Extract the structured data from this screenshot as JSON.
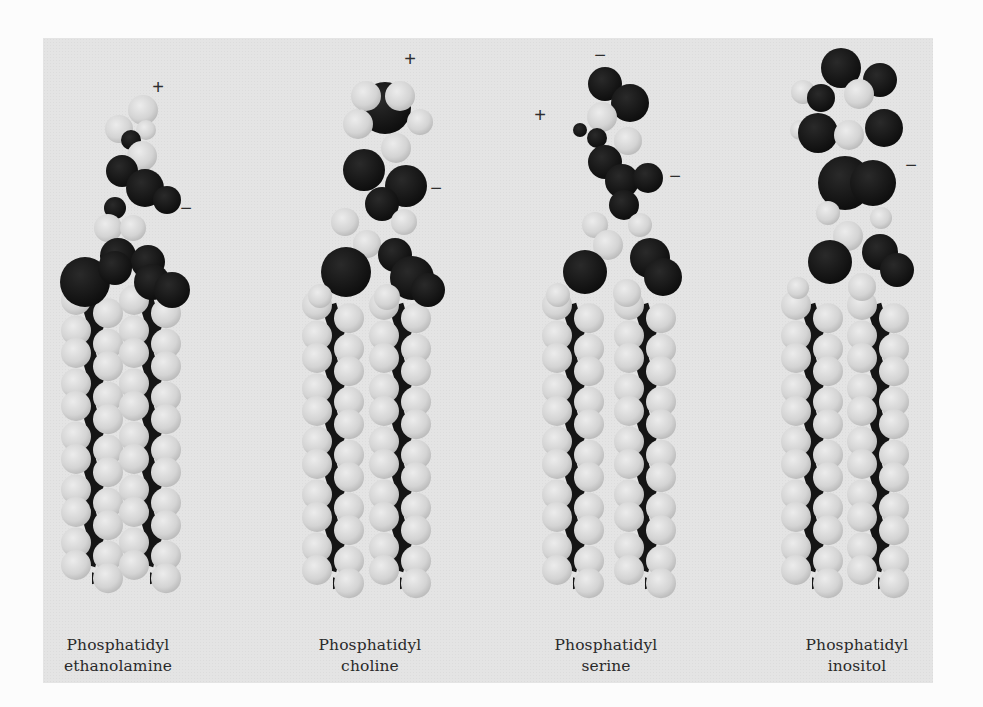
{
  "figure": {
    "background_color": "#e4e4e4",
    "dark_atom_color": "#161616",
    "light_atom_color": "#d9d9d9",
    "molecules": [
      {
        "id": "pe",
        "label_line1": "Phosphatidyl",
        "label_line2": "ethanolamine",
        "label_x": 18,
        "label_y": 635,
        "charges": [
          {
            "symbol": "+",
            "x": 158,
            "y": 87
          },
          {
            "symbol": "−",
            "x": 186,
            "y": 208
          }
        ],
        "tails": {
          "left_x": 92,
          "right_x": 150,
          "top_y": 300,
          "rows": 11,
          "step": 26.5,
          "offset": 14
        },
        "head_atoms": [
          {
            "t": "L",
            "x": 143,
            "y": 110,
            "r": 15
          },
          {
            "t": "L",
            "x": 119,
            "y": 129,
            "r": 14
          },
          {
            "t": "L",
            "x": 146,
            "y": 130,
            "r": 10
          },
          {
            "t": "D",
            "x": 131,
            "y": 140,
            "r": 10
          },
          {
            "t": "L",
            "x": 142,
            "y": 156,
            "r": 15
          },
          {
            "t": "D",
            "x": 122,
            "y": 171,
            "r": 16
          },
          {
            "t": "D",
            "x": 145,
            "y": 188,
            "r": 19
          },
          {
            "t": "D",
            "x": 167,
            "y": 200,
            "r": 14
          },
          {
            "t": "D",
            "x": 115,
            "y": 208,
            "r": 11
          },
          {
            "t": "L",
            "x": 108,
            "y": 228,
            "r": 14
          },
          {
            "t": "L",
            "x": 133,
            "y": 228,
            "r": 13
          },
          {
            "t": "D",
            "x": 118,
            "y": 256,
            "r": 18
          },
          {
            "t": "D",
            "x": 148,
            "y": 262,
            "r": 17
          },
          {
            "t": "D",
            "x": 85,
            "y": 282,
            "r": 25
          },
          {
            "t": "D",
            "x": 115,
            "y": 268,
            "r": 17
          },
          {
            "t": "D",
            "x": 152,
            "y": 282,
            "r": 18
          },
          {
            "t": "D",
            "x": 172,
            "y": 290,
            "r": 18
          }
        ]
      },
      {
        "id": "pc",
        "label_line1": "Phosphatidyl",
        "label_line2": "choline",
        "label_x": 270,
        "label_y": 635,
        "charges": [
          {
            "symbol": "+",
            "x": 410,
            "y": 59
          },
          {
            "symbol": "−",
            "x": 436,
            "y": 188
          }
        ],
        "tails": {
          "left_x": 333,
          "right_x": 400,
          "top_y": 305,
          "rows": 11,
          "step": 26.5,
          "offset": 14
        },
        "head_atoms": [
          {
            "t": "D",
            "x": 385,
            "y": 108,
            "r": 26
          },
          {
            "t": "L",
            "x": 366,
            "y": 96,
            "r": 15
          },
          {
            "t": "L",
            "x": 400,
            "y": 96,
            "r": 15
          },
          {
            "t": "L",
            "x": 358,
            "y": 124,
            "r": 15
          },
          {
            "t": "L",
            "x": 420,
            "y": 122,
            "r": 13
          },
          {
            "t": "L",
            "x": 396,
            "y": 148,
            "r": 15
          },
          {
            "t": "D",
            "x": 364,
            "y": 170,
            "r": 21
          },
          {
            "t": "D",
            "x": 406,
            "y": 186,
            "r": 21
          },
          {
            "t": "D",
            "x": 382,
            "y": 204,
            "r": 17
          },
          {
            "t": "L",
            "x": 345,
            "y": 222,
            "r": 14
          },
          {
            "t": "L",
            "x": 404,
            "y": 222,
            "r": 13
          },
          {
            "t": "L",
            "x": 367,
            "y": 244,
            "r": 14
          },
          {
            "t": "D",
            "x": 395,
            "y": 255,
            "r": 17
          },
          {
            "t": "D",
            "x": 346,
            "y": 272,
            "r": 25
          },
          {
            "t": "D",
            "x": 412,
            "y": 278,
            "r": 22
          },
          {
            "t": "D",
            "x": 428,
            "y": 290,
            "r": 17
          },
          {
            "t": "L",
            "x": 320,
            "y": 296,
            "r": 12
          },
          {
            "t": "L",
            "x": 387,
            "y": 297,
            "r": 13
          }
        ]
      },
      {
        "id": "ps",
        "label_line1": "Phosphatidyl",
        "label_line2": "serine",
        "label_x": 506,
        "label_y": 635,
        "charges": [
          {
            "symbol": "−",
            "x": 600,
            "y": 55
          },
          {
            "symbol": "+",
            "x": 540,
            "y": 115
          },
          {
            "symbol": "−",
            "x": 675,
            "y": 176
          }
        ],
        "tails": {
          "left_x": 573,
          "right_x": 645,
          "top_y": 305,
          "rows": 11,
          "step": 26.5,
          "offset": 14
        },
        "head_atoms": [
          {
            "t": "D",
            "x": 605,
            "y": 84,
            "r": 17
          },
          {
            "t": "D",
            "x": 630,
            "y": 103,
            "r": 19
          },
          {
            "t": "D",
            "x": 580,
            "y": 130,
            "r": 7
          },
          {
            "t": "L",
            "x": 602,
            "y": 117,
            "r": 15
          },
          {
            "t": "D",
            "x": 597,
            "y": 138,
            "r": 10
          },
          {
            "t": "L",
            "x": 628,
            "y": 141,
            "r": 14
          },
          {
            "t": "D",
            "x": 605,
            "y": 162,
            "r": 17
          },
          {
            "t": "D",
            "x": 622,
            "y": 181,
            "r": 17
          },
          {
            "t": "D",
            "x": 648,
            "y": 178,
            "r": 15
          },
          {
            "t": "D",
            "x": 624,
            "y": 205,
            "r": 15
          },
          {
            "t": "L",
            "x": 595,
            "y": 225,
            "r": 13
          },
          {
            "t": "L",
            "x": 640,
            "y": 225,
            "r": 12
          },
          {
            "t": "L",
            "x": 608,
            "y": 245,
            "r": 15
          },
          {
            "t": "D",
            "x": 650,
            "y": 258,
            "r": 20
          },
          {
            "t": "D",
            "x": 585,
            "y": 272,
            "r": 22
          },
          {
            "t": "D",
            "x": 663,
            "y": 277,
            "r": 19
          },
          {
            "t": "L",
            "x": 558,
            "y": 295,
            "r": 12
          },
          {
            "t": "L",
            "x": 627,
            "y": 293,
            "r": 14
          }
        ]
      },
      {
        "id": "pi",
        "label_line1": "Phosphatidyl",
        "label_line2": "inositol",
        "label_x": 757,
        "label_y": 635,
        "charges": [
          {
            "symbol": "−",
            "x": 911,
            "y": 165
          }
        ],
        "tails": {
          "left_x": 812,
          "right_x": 878,
          "top_y": 305,
          "rows": 11,
          "step": 26.5,
          "offset": 14
        },
        "head_atoms": [
          {
            "t": "L",
            "x": 803,
            "y": 92,
            "r": 12
          },
          {
            "t": "L",
            "x": 800,
            "y": 130,
            "r": 10
          },
          {
            "t": "D",
            "x": 841,
            "y": 68,
            "r": 20
          },
          {
            "t": "D",
            "x": 821,
            "y": 98,
            "r": 14
          },
          {
            "t": "D",
            "x": 880,
            "y": 80,
            "r": 17
          },
          {
            "t": "D",
            "x": 818,
            "y": 133,
            "r": 20
          },
          {
            "t": "D",
            "x": 884,
            "y": 128,
            "r": 19
          },
          {
            "t": "L",
            "x": 859,
            "y": 94,
            "r": 15
          },
          {
            "t": "L",
            "x": 849,
            "y": 135,
            "r": 15
          },
          {
            "t": "D",
            "x": 845,
            "y": 183,
            "r": 27
          },
          {
            "t": "D",
            "x": 873,
            "y": 183,
            "r": 23
          },
          {
            "t": "L",
            "x": 828,
            "y": 213,
            "r": 12
          },
          {
            "t": "L",
            "x": 881,
            "y": 218,
            "r": 11
          },
          {
            "t": "L",
            "x": 848,
            "y": 236,
            "r": 15
          },
          {
            "t": "D",
            "x": 880,
            "y": 252,
            "r": 18
          },
          {
            "t": "D",
            "x": 830,
            "y": 262,
            "r": 22
          },
          {
            "t": "D",
            "x": 897,
            "y": 270,
            "r": 17
          },
          {
            "t": "L",
            "x": 798,
            "y": 288,
            "r": 11
          },
          {
            "t": "L",
            "x": 862,
            "y": 287,
            "r": 14
          }
        ]
      }
    ]
  }
}
